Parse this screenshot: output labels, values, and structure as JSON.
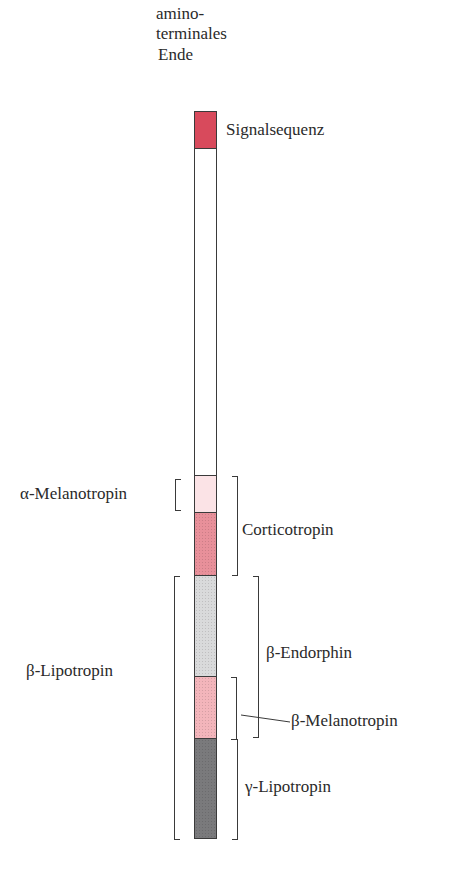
{
  "diagram": {
    "header_label": [
      "amino-",
      "terminales",
      "Ende"
    ],
    "segments": [
      {
        "name": "Signalsequenz",
        "color": "#d84a5c",
        "top": 111,
        "bottom": 148
      },
      {
        "name": "(unlabeled)",
        "color": "#ffffff",
        "top": 148,
        "bottom": 475
      },
      {
        "name": "α-Melanotropin",
        "color": "#fbe3e6",
        "top": 475,
        "bottom": 512
      },
      {
        "name": "Corticotropin (rest)",
        "color": "#e8909a",
        "top": 512,
        "bottom": 575
      },
      {
        "name": "β-Endorphin (non-melanotropin part)",
        "color": "#d9dadb",
        "top": 575,
        "bottom": 676
      },
      {
        "name": "β-Melanotropin",
        "color": "#f3b5bb",
        "top": 676,
        "bottom": 738
      },
      {
        "name": "γ-Lipotropin (rest)",
        "color": "#7a7a7c",
        "top": 738,
        "bottom": 838
      }
    ],
    "labels": {
      "signal": "Signalsequenz",
      "alpha_mel": "α-Melanotropin",
      "cortico": "Corticotropin",
      "beta_endo": "β-Endorphin",
      "beta_lipo": "β-Lipotropin",
      "beta_mel": "β-Melanotropin",
      "gamma_lipo": "γ-Lipotropin"
    }
  }
}
